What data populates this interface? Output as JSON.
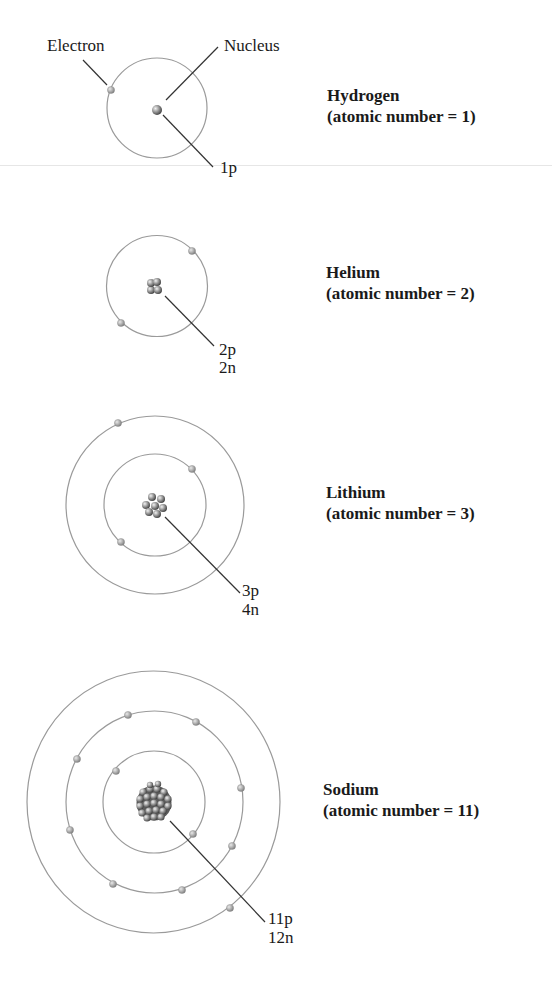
{
  "figure": {
    "callouts": {
      "electron_label": "Electron",
      "nucleus_label": "Nucleus"
    },
    "atoms": [
      {
        "name": "Hydrogen",
        "atomic_number_text": "(atomic number = 1)",
        "atomic_number": 1,
        "protons_label": "1p",
        "neutrons_label": "",
        "protons": 1,
        "neutrons": 0,
        "shells": [
          1
        ]
      },
      {
        "name": "Helium",
        "atomic_number_text": "(atomic number = 2)",
        "atomic_number": 2,
        "protons_label": "2p",
        "neutrons_label": "2n",
        "protons": 2,
        "neutrons": 2,
        "shells": [
          2
        ]
      },
      {
        "name": "Lithium",
        "atomic_number_text": "(atomic number = 3)",
        "atomic_number": 3,
        "protons_label": "3p",
        "neutrons_label": "4n",
        "protons": 3,
        "neutrons": 4,
        "shells": [
          2,
          1
        ]
      },
      {
        "name": "Sodium",
        "atomic_number_text": "(atomic number = 11)",
        "atomic_number": 11,
        "protons_label": "11p",
        "neutrons_label": "12n",
        "protons": 11,
        "neutrons": 12,
        "shells": [
          2,
          8,
          1
        ]
      }
    ],
    "colors": {
      "orbit": "#9a9a9a",
      "leader_line": "#333333",
      "electron": "#a8a8a8",
      "nucleus_dark": "#4a4a4a",
      "nucleus_light": "#e0e0e0",
      "text": "#1a1a1a"
    }
  }
}
